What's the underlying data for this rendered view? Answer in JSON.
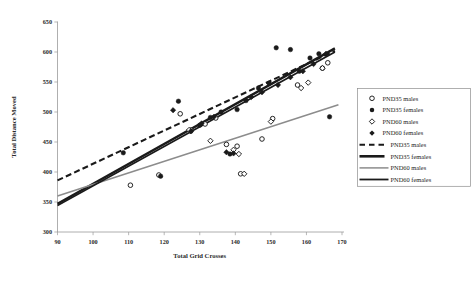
{
  "chart_data": {
    "type": "scatter",
    "title": "",
    "xlabel": "Total Grid Crosses",
    "ylabel": "Total Distance Moved",
    "xlim": [
      90,
      170
    ],
    "ylim": [
      300,
      650
    ],
    "xticks": [
      90,
      100,
      110,
      120,
      130,
      140,
      150,
      160,
      170
    ],
    "yticks": [
      300,
      350,
      400,
      450,
      500,
      550,
      600,
      650
    ],
    "grid": false,
    "legend_position": "right",
    "series": [
      {
        "name": "PND35 males",
        "marker": "open-circle",
        "color": "#1a1a1a",
        "points": [
          [
            110.5,
            378
          ],
          [
            118.5,
            395
          ],
          [
            124.5,
            497
          ],
          [
            127.5,
            470
          ],
          [
            131.5,
            480
          ],
          [
            134.5,
            490
          ],
          [
            137.5,
            446
          ],
          [
            140.5,
            443
          ],
          [
            141.5,
            397
          ],
          [
            147.5,
            455
          ],
          [
            150.5,
            489
          ],
          [
            157.5,
            545
          ],
          [
            164.5,
            573
          ],
          [
            166.0,
            582
          ]
        ]
      },
      {
        "name": "PND35 females",
        "marker": "filled-circle",
        "color": "#1a1a1a",
        "points": [
          [
            108.5,
            432
          ],
          [
            119.0,
            393
          ],
          [
            124.0,
            518
          ],
          [
            127.5,
            468
          ],
          [
            130.0,
            478
          ],
          [
            133.0,
            491
          ],
          [
            136.0,
            500
          ],
          [
            138.5,
            430
          ],
          [
            140.5,
            504
          ],
          [
            143.0,
            519
          ],
          [
            146.5,
            540
          ],
          [
            149.5,
            548
          ],
          [
            151.5,
            607
          ],
          [
            155.5,
            604
          ],
          [
            158.0,
            568
          ],
          [
            161.0,
            590
          ],
          [
            163.5,
            597
          ],
          [
            166.5,
            492
          ]
        ]
      },
      {
        "name": "PND60 males",
        "marker": "open-diamond",
        "color": "#1a1a1a",
        "points": [
          [
            127.0,
            470
          ],
          [
            133.0,
            452
          ],
          [
            139.5,
            437
          ],
          [
            141.0,
            430
          ],
          [
            142.5,
            397
          ],
          [
            150.0,
            484
          ],
          [
            158.5,
            540
          ],
          [
            160.5,
            549
          ],
          [
            164.5,
            573
          ]
        ]
      },
      {
        "name": "PND60 females",
        "marker": "filled-diamond",
        "color": "#1a1a1a",
        "points": [
          [
            122.5,
            503
          ],
          [
            127.5,
            468
          ],
          [
            130.5,
            481
          ],
          [
            134.0,
            492
          ],
          [
            137.5,
            433
          ],
          [
            139.5,
            431
          ],
          [
            144.5,
            525
          ],
          [
            147.5,
            533
          ],
          [
            152.0,
            545
          ],
          [
            155.5,
            558
          ],
          [
            159.0,
            568
          ],
          [
            162.0,
            580
          ],
          [
            165.5,
            597
          ]
        ]
      }
    ],
    "trendlines": [
      {
        "name": "PND35 males",
        "style": "dashed",
        "color": "#1a1a1a",
        "width": 2.1,
        "x0": 90,
        "y0": 386,
        "x1": 168,
        "y1": 602
      },
      {
        "name": "PND35 females",
        "style": "solid-thick",
        "color": "#1a1a1a",
        "width": 2.4,
        "x0": 90,
        "y0": 347,
        "x1": 168,
        "y1": 606
      },
      {
        "name": "PND60 males",
        "style": "solid-thin-gray",
        "color": "#8c8c8c",
        "width": 1.5,
        "x0": 90,
        "y0": 360,
        "x1": 169,
        "y1": 512
      },
      {
        "name": "PND60 females",
        "style": "solid-black",
        "color": "#1a1a1a",
        "width": 1.7,
        "x0": 90,
        "y0": 344,
        "x1": 168,
        "y1": 600
      }
    ]
  },
  "legend": {
    "items": [
      {
        "label": "PND35 males",
        "symbol": "open-circle"
      },
      {
        "label": "PND35 females",
        "symbol": "filled-circle"
      },
      {
        "label": "PND60 males",
        "symbol": "open-diamond"
      },
      {
        "label": "PND60 females",
        "symbol": "filled-diamond"
      },
      {
        "label": "PND35 males",
        "symbol": "dashed-line"
      },
      {
        "label": "PND35 females",
        "symbol": "thick-line"
      },
      {
        "label": "PND60 males",
        "symbol": "gray-line"
      },
      {
        "label": "PND60 females",
        "symbol": "black-line"
      }
    ]
  }
}
